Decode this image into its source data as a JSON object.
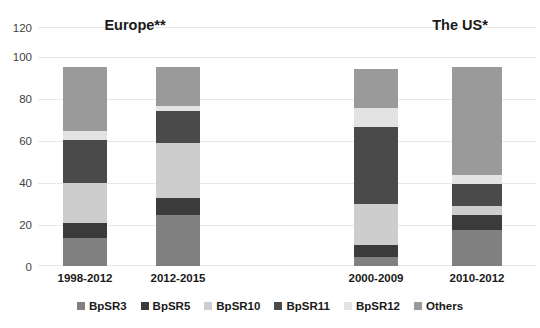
{
  "chart_data": {
    "type": "bar",
    "subtype": "stacked-percentage",
    "title": "",
    "xlabel": "",
    "ylabel": "",
    "ylim": [
      0,
      120
    ],
    "yticks": [
      0,
      20,
      40,
      60,
      80,
      100,
      120
    ],
    "grid": true,
    "legend_position": "bottom",
    "groups": [
      {
        "label": "Europe**",
        "categories": [
          "1998-2012",
          "2012-2015"
        ]
      },
      {
        "label": "The US*",
        "categories": [
          "2000-2009",
          "2010-2012"
        ]
      }
    ],
    "categories": [
      "1998-2012",
      "2012-2015",
      "2000-2009",
      "2010-2012"
    ],
    "series": [
      {
        "name": "BpSR3",
        "color": "#808080",
        "values": [
          13.9,
          25.8,
          4.3,
          18.2
        ]
      },
      {
        "name": "BpSR5",
        "color": "#3b3b3b",
        "values": [
          7.6,
          8.2,
          6.2,
          7.2
        ]
      },
      {
        "name": "BpSR10",
        "color": "#cdcdcd",
        "values": [
          20.1,
          27.7,
          20.6,
          4.7
        ]
      },
      {
        "name": "BpSR11",
        "color": "#4a4a4a",
        "values": [
          21.9,
          16.3,
          38.8,
          11.0
        ]
      },
      {
        "name": "BpSR12",
        "color": "#e3e3e3",
        "values": [
          4.5,
          2.4,
          9.5,
          4.4
        ]
      },
      {
        "name": "Others",
        "color": "#9a9a9a",
        "values": [
          32.0,
          19.6,
          19.6,
          54.5
        ]
      }
    ],
    "legend": [
      {
        "label": "BpSR3",
        "color": "#808080"
      },
      {
        "label": "BpSR5",
        "color": "#3b3b3b"
      },
      {
        "label": "BpSR10",
        "color": "#cdcdcd"
      },
      {
        "label": "BpSR11",
        "color": "#4a4a4a"
      },
      {
        "label": "BpSR12",
        "color": "#e3e3e3"
      },
      {
        "label": "Others",
        "color": "#9a9a9a"
      }
    ]
  },
  "axis": {
    "y_labels": [
      "120",
      "100",
      "80",
      "60",
      "40",
      "20",
      "0"
    ]
  },
  "titles": {
    "europe": "Europe**",
    "us": "The US*"
  },
  "cat_labels": {
    "c0": "1998-2012",
    "c1": "2012-2015",
    "c2": "2000-2009",
    "c3": "2010-2012"
  },
  "legend_labels": {
    "l0": "BpSR3",
    "l1": "BpSR5",
    "l2": "BpSR10",
    "l3": "BpSR11",
    "l4": "BpSR12",
    "l5": "Others"
  }
}
